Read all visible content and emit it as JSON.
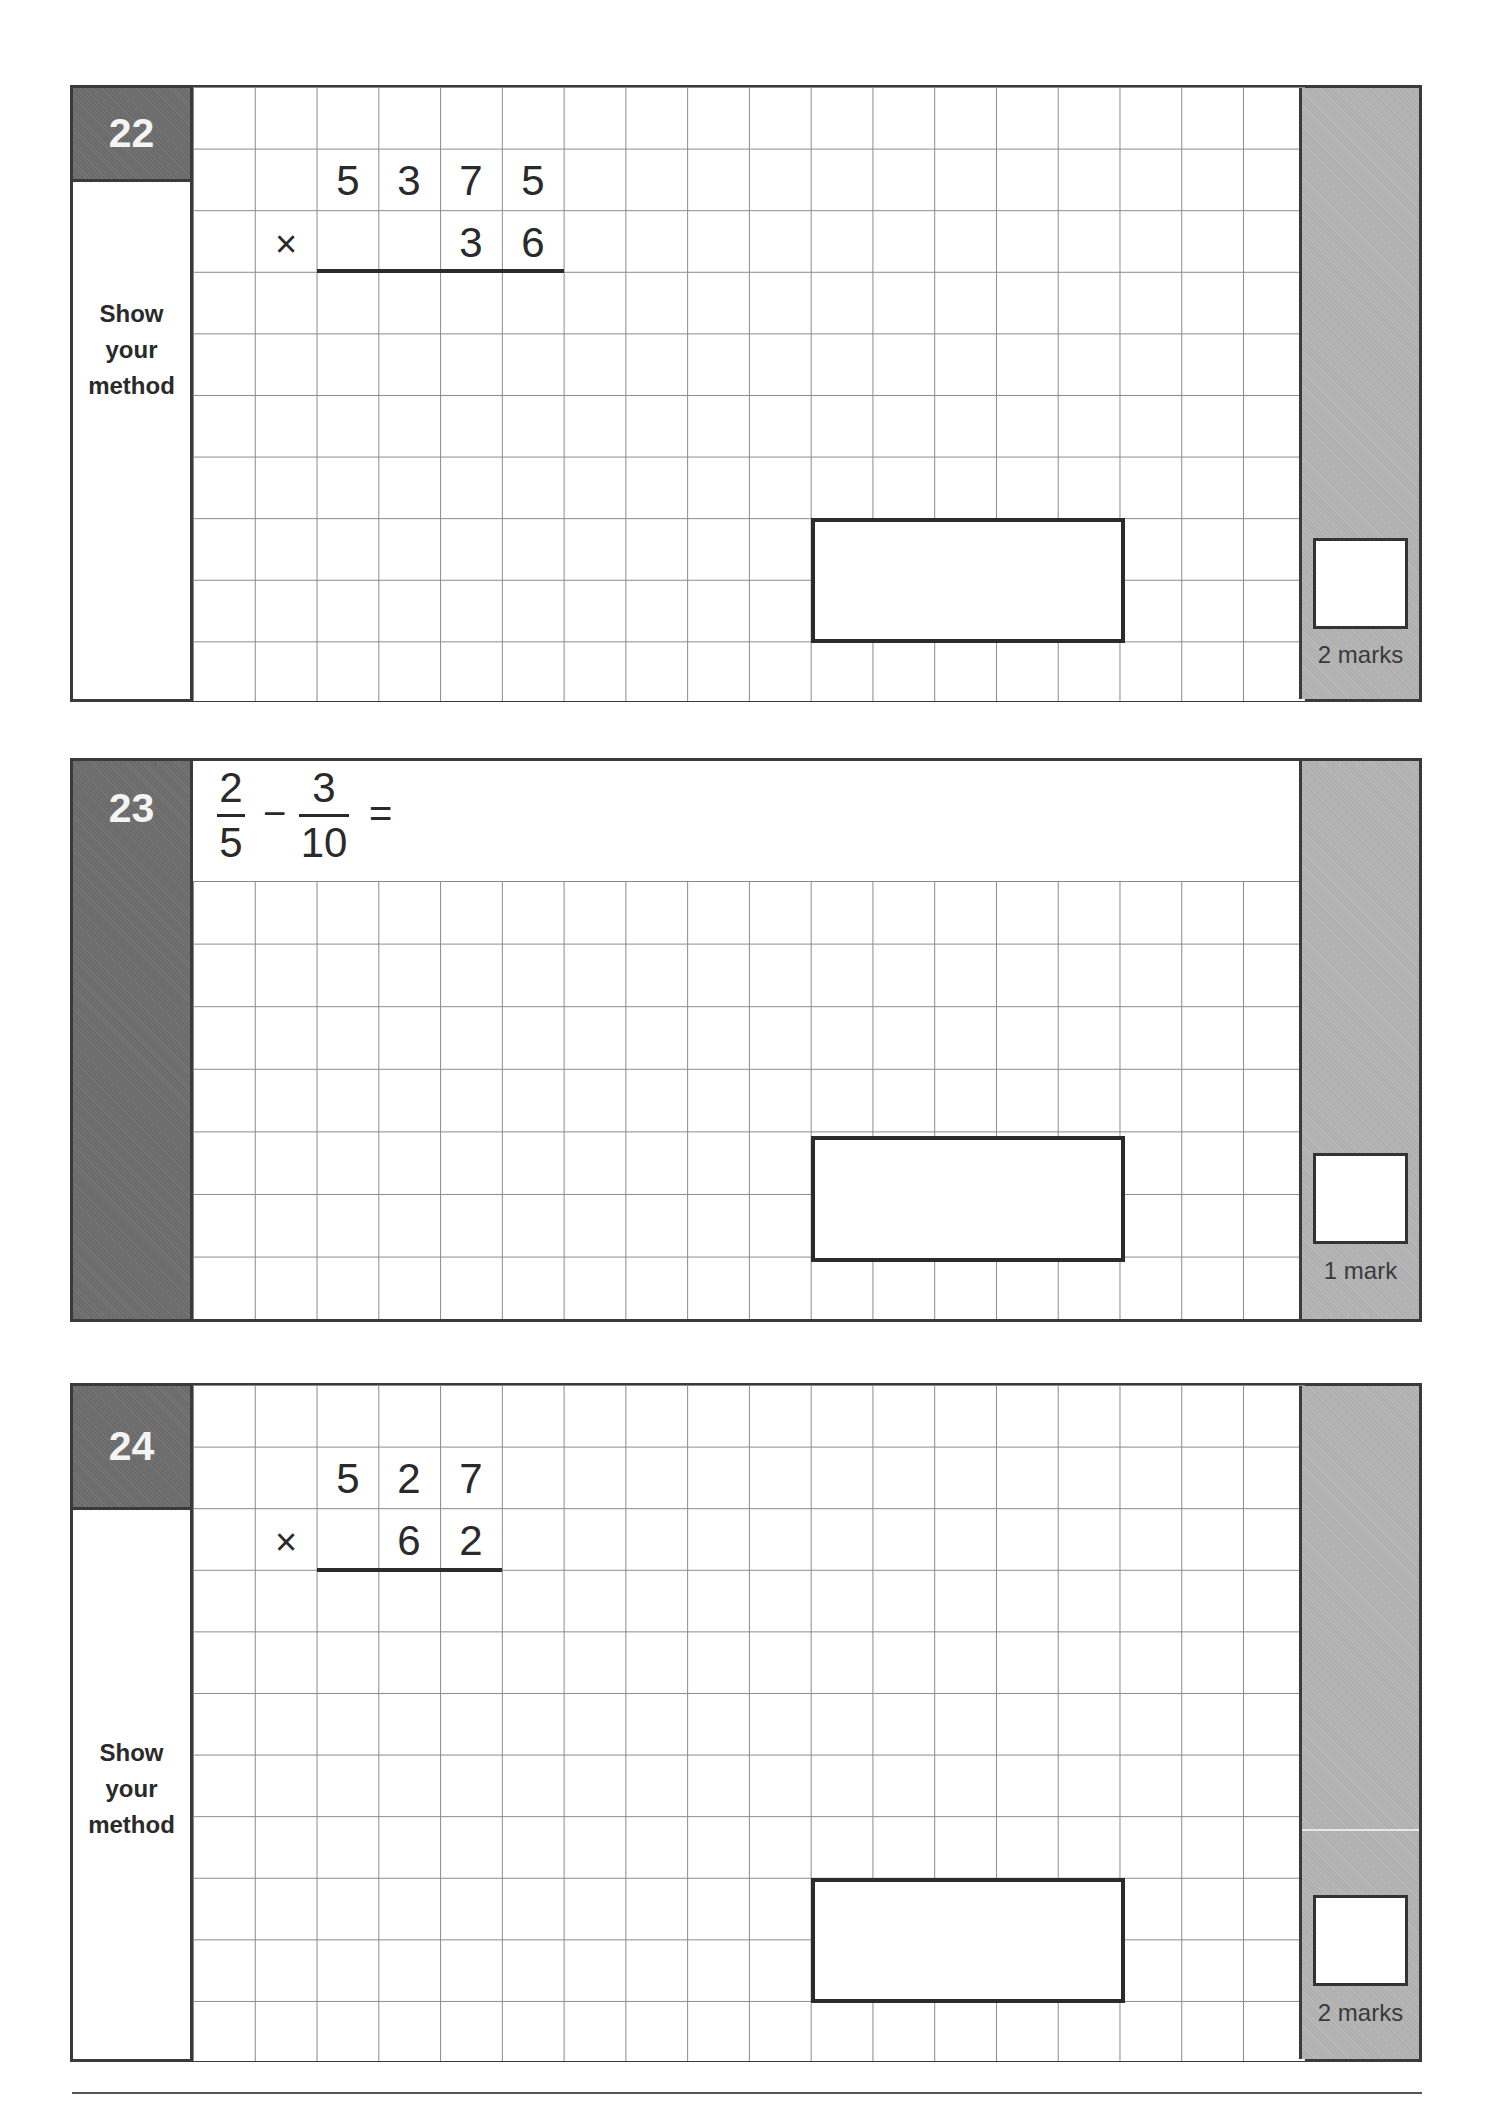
{
  "questions": [
    {
      "number": "22",
      "left_label": [
        "Show",
        "your",
        "method"
      ],
      "problem_type": "long-multiplication",
      "multiplicand": [
        "5",
        "3",
        "7",
        "5"
      ],
      "operator": "×",
      "multiplier": [
        "3",
        "6"
      ],
      "marks_label": "2 marks"
    },
    {
      "number": "23",
      "problem_type": "fraction-subtraction",
      "fraction1": {
        "numerator": "2",
        "denominator": "5"
      },
      "operator": "−",
      "fraction2": {
        "numerator": "3",
        "denominator": "10"
      },
      "equals": "=",
      "marks_label": "1 mark"
    },
    {
      "number": "24",
      "left_label": [
        "Show",
        "your",
        "method"
      ],
      "problem_type": "long-multiplication",
      "multiplicand": [
        "5",
        "2",
        "7"
      ],
      "operator": "×",
      "multiplier": [
        "6",
        "2"
      ],
      "marks_label": "2 marks"
    }
  ],
  "colors": {
    "number_box": "#707070",
    "marks_column": "#b6b6b6",
    "grid_lines": "#8a8a8a",
    "borders": "#3a3a3a"
  }
}
